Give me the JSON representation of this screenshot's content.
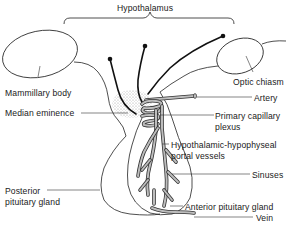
{
  "title": "Hypothalamus",
  "labels": {
    "hypothalamus": "Hypothalamus",
    "mammillary_body": "Mammillary body",
    "optic_chiasm": "Optic chiasm",
    "median_eminence": "Median eminence",
    "artery": "Artery",
    "primary_capillary_plexus_1": "Primary capillary",
    "primary_capillary_plexus_2": "plexus",
    "portal_vessels_1": "Hypothalamic-hypophyseal",
    "portal_vessels_2": "portal vessels",
    "sinuses": "Sinuses",
    "posterior_pituitary_1": "Posterior",
    "posterior_pituitary_2": "pituitary gland",
    "anterior_pituitary": "Anterior pituitary gland",
    "vein": "Vein"
  },
  "colors": {
    "line": "#222222",
    "vessel_fill": "#bdbdbd",
    "stipple": "#cfcfcf",
    "background": "#ffffff"
  }
}
